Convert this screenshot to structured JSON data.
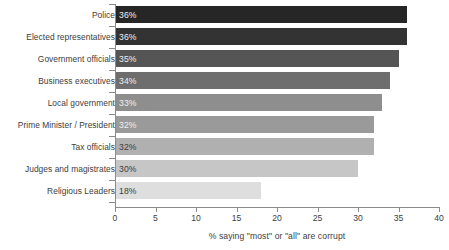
{
  "chart_data": {
    "type": "bar",
    "orientation": "horizontal",
    "title": "",
    "subtitle": "",
    "xlabel": "% saying \"most\" or \"all\" are corrupt",
    "ylabel": "",
    "xlim": [
      0,
      40
    ],
    "xticks": [
      0,
      5,
      10,
      15,
      20,
      25,
      30,
      35,
      40
    ],
    "xtick_labels": [
      "0",
      "5",
      "10",
      "15",
      "20",
      "25",
      "30",
      "35",
      "40"
    ],
    "grid": false,
    "legend": false,
    "categories": [
      "Police",
      "Elected representatives",
      "Government officials",
      "Business executives",
      "Local government",
      "Prime Minister / President",
      "Tax officials",
      "Judges and magistrates",
      "Religious Leaders"
    ],
    "values": [
      36,
      36,
      35,
      34,
      33,
      32,
      32,
      30,
      18
    ],
    "value_labels": [
      "36%",
      "36%",
      "35%",
      "34%",
      "33%",
      "32%",
      "32%",
      "30%",
      "18%"
    ],
    "bar_colors": [
      "#262626",
      "#333333",
      "#555555",
      "#6e6e6e",
      "#8e8e8e",
      "#9a9a9a",
      "#b0b0b0",
      "#c6c6c6",
      "#dedede"
    ],
    "value_label_colors": [
      "#f2f2f2",
      "#f2f2f2",
      "#ededed",
      "#ededed",
      "#f0f0f0",
      "#f0f0f0",
      "#3d3d3d",
      "#3d3d3d",
      "#3d3d3d"
    ],
    "axis_color": "#8a8a8a",
    "background_color": "#ffffff"
  }
}
